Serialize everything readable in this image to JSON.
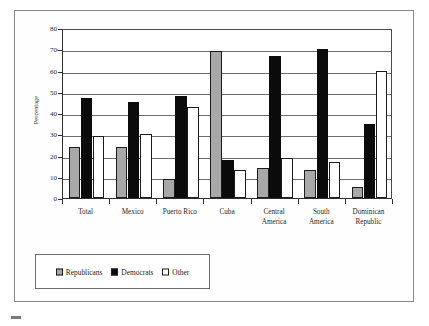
{
  "figure": {
    "background_color": "#ffffff",
    "frame_color": "#8a8a8a"
  },
  "chart_data": {
    "type": "bar",
    "title": "",
    "subtitle": "",
    "xlabel": "",
    "ylabel": "Percentage",
    "ylim": [
      0,
      80
    ],
    "y_ticks": [
      0,
      10,
      20,
      30,
      40,
      50,
      60,
      70,
      80
    ],
    "grid": true,
    "grid_axis": "y",
    "legend_position": "bottom-left",
    "categories": [
      "Total",
      "Mexico",
      "Puerto Rico",
      "Cuba",
      "Central America",
      "South America",
      "Dominican Republic"
    ],
    "category_label_lines": [
      [
        "Total"
      ],
      [
        "Mexico"
      ],
      [
        "Puerto Rico"
      ],
      [
        "Cuba"
      ],
      [
        "Central",
        "America"
      ],
      [
        "South",
        "America"
      ],
      [
        "Dominican",
        "Republic"
      ]
    ],
    "series": [
      {
        "name": "Republicans",
        "color": "#a8a8a8",
        "edge_color": "#1c1c1c",
        "values": [
          24,
          24,
          9,
          69,
          14,
          13,
          5
        ]
      },
      {
        "name": "Democrats",
        "color": "#0b0b0b",
        "edge_color": "#0b0b0b",
        "values": [
          47,
          45,
          48,
          18,
          67,
          70,
          35
        ]
      },
      {
        "name": "Other",
        "color": "#ffffff",
        "edge_color": "#1c1c1c",
        "values": [
          29,
          30,
          43,
          13,
          19,
          17,
          60
        ]
      }
    ]
  },
  "legend": {
    "entries": [
      {
        "label": "Republicans",
        "swatch": "rep"
      },
      {
        "label": "Democrats",
        "swatch": "dem"
      },
      {
        "label": "Other",
        "swatch": "oth"
      }
    ]
  }
}
